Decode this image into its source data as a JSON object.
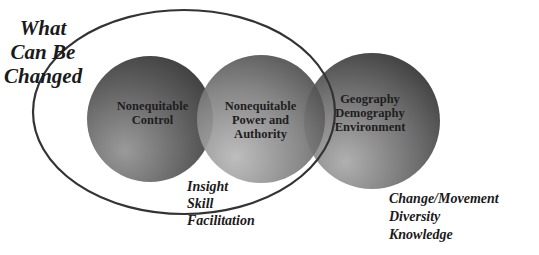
{
  "title": {
    "text": "What\nCan Be\nChanged"
  },
  "circles": [
    {
      "label": "Nonequitable\nControl",
      "color": "#595959"
    },
    {
      "label": "Nonequitable\nPower and\nAuthority",
      "color": "#777777"
    },
    {
      "label": "Geography\nDemography\nEnvironment",
      "color": "#6a6a6a"
    }
  ],
  "ellipse": {
    "color": "#3a3a3a"
  },
  "notes": {
    "inner": "Insight\nSkill\nFacilitation",
    "outer": "Change/Movement\nDiversity\nKnowledge"
  }
}
